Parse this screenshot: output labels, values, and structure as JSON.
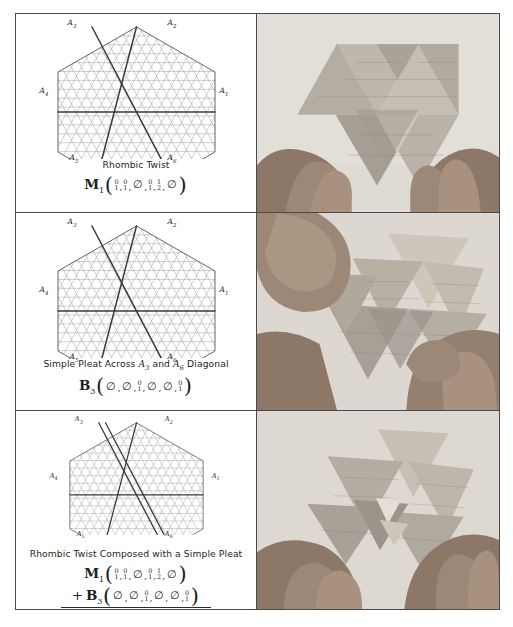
{
  "figure": {
    "panels": [
      {
        "id": "panel-1",
        "caption": "Rhombic Twist",
        "caption_parts": [
          {
            "t": "Rhombic Twist",
            "i": false
          }
        ],
        "diagram": {
          "name": "hexagon-triangular-grid-rhombic-twist",
          "vertices": [
            {
              "label": "A",
              "sub": "3",
              "pos": "top-left"
            },
            {
              "label": "A",
              "sub": "2",
              "pos": "top-right"
            },
            {
              "label": "A",
              "sub": "1",
              "pos": "right"
            },
            {
              "label": "A",
              "sub": "6",
              "pos": "bottom-right"
            },
            {
              "label": "A",
              "sub": "5",
              "pos": "bottom-left"
            },
            {
              "label": "A",
              "sub": "4",
              "pos": "left"
            }
          ],
          "bold_creases": [
            "A1-A4 horizontal",
            "A2-A5 diagonal",
            "A3-A6 diagonal"
          ],
          "double_line": false
        },
        "formulas": [
          {
            "symbol": "M",
            "sub": "1",
            "args": [
              {
                "type": "frac",
                "n": "0",
                "d": "1",
                "boxed": false
              },
              {
                "type": "frac",
                "n": "0",
                "d": "1",
                "boxed": false
              },
              {
                "type": "empty",
                "glyph": "∅"
              },
              {
                "type": "frac",
                "n": "0",
                "d": "1",
                "boxed": false
              },
              {
                "type": "frac",
                "n": "1",
                "d": "2",
                "boxed": false
              },
              {
                "type": "empty",
                "glyph": "∅"
              }
            ]
          }
        ],
        "photo_alt": "hands-folding-origami-rhombic-twist"
      },
      {
        "id": "panel-2",
        "caption": "Simple Pleat Across A3 and A6 Diagonal",
        "caption_parts": [
          {
            "t": "Simple Pleat Across ",
            "i": false
          },
          {
            "t": "A",
            "sub": "3",
            "i": true
          },
          {
            "t": " and ",
            "i": false
          },
          {
            "t": "A",
            "sub": "6",
            "i": true
          },
          {
            "t": " Diagonal",
            "i": false
          }
        ],
        "diagram": {
          "name": "hexagon-triangular-grid-simple-pleat",
          "vertices": [
            {
              "label": "A",
              "sub": "3",
              "pos": "top-left"
            },
            {
              "label": "A",
              "sub": "2",
              "pos": "top-right"
            },
            {
              "label": "A",
              "sub": "1",
              "pos": "right"
            },
            {
              "label": "A",
              "sub": "6",
              "pos": "bottom-right"
            },
            {
              "label": "A",
              "sub": "5",
              "pos": "bottom-left"
            },
            {
              "label": "A",
              "sub": "4",
              "pos": "left"
            }
          ],
          "bold_creases": [
            "A1-A4 horizontal",
            "A2-A5 diagonal",
            "A3-A6 diagonal"
          ],
          "double_line": false
        },
        "formulas": [
          {
            "symbol": "B",
            "sub": "3",
            "args": [
              {
                "type": "empty",
                "glyph": "∅"
              },
              {
                "type": "empty",
                "glyph": "∅"
              },
              {
                "type": "frac",
                "n": "0",
                "d": "1",
                "boxed": false
              },
              {
                "type": "empty",
                "glyph": "∅"
              },
              {
                "type": "empty",
                "glyph": "∅"
              },
              {
                "type": "frac",
                "n": "0",
                "d": "1",
                "boxed": false
              }
            ]
          }
        ],
        "photo_alt": "hands-folding-origami-simple-pleat"
      },
      {
        "id": "panel-3",
        "caption": "Rhombic Twist Composed with a Simple Pleat",
        "caption_parts": [
          {
            "t": "Rhombic Twist Composed with a Simple Pleat",
            "i": false
          }
        ],
        "diagram": {
          "name": "hexagon-triangular-grid-composed",
          "vertices": [
            {
              "label": "A",
              "sub": "3",
              "pos": "top-left"
            },
            {
              "label": "A",
              "sub": "2",
              "pos": "top-right"
            },
            {
              "label": "A",
              "sub": "1",
              "pos": "right"
            },
            {
              "label": "A",
              "sub": "6",
              "pos": "bottom-right"
            },
            {
              "label": "A",
              "sub": "5",
              "pos": "bottom-left"
            },
            {
              "label": "A",
              "sub": "4",
              "pos": "left"
            }
          ],
          "bold_creases": [
            "A1-A4 horizontal",
            "A2-A5 diagonal",
            "A3-A6 diagonal doubled"
          ],
          "double_line": true
        },
        "formulas": [
          {
            "symbol": "M",
            "sub": "1",
            "prefix": "",
            "args": [
              {
                "type": "frac",
                "n": "0",
                "d": "1",
                "boxed": false
              },
              {
                "type": "frac",
                "n": "0",
                "d": "1",
                "boxed": false
              },
              {
                "type": "empty",
                "glyph": "∅"
              },
              {
                "type": "frac",
                "n": "0",
                "d": "1",
                "boxed": false
              },
              {
                "type": "frac",
                "n": "1",
                "d": "2",
                "boxed": false
              },
              {
                "type": "empty",
                "glyph": "∅"
              }
            ]
          },
          {
            "symbol": "B",
            "sub": "3",
            "prefix": "+",
            "args": [
              {
                "type": "empty",
                "glyph": "∅"
              },
              {
                "type": "empty",
                "glyph": "∅"
              },
              {
                "type": "frac",
                "n": "0",
                "d": "1",
                "boxed": false
              },
              {
                "type": "empty",
                "glyph": "∅"
              },
              {
                "type": "empty",
                "glyph": "∅"
              },
              {
                "type": "frac",
                "n": "0",
                "d": "1",
                "boxed": false
              }
            ]
          },
          {
            "symbol": "H",
            "sub": "1",
            "prefix": "",
            "result": true,
            "args": [
              {
                "type": "frac",
                "n": "0",
                "d": "1",
                "boxed": false
              },
              {
                "type": "frac",
                "n": "0",
                "d": "1",
                "boxed": false
              },
              {
                "type": "frac",
                "n": "0",
                "d": "1",
                "boxed": true
              },
              {
                "type": "frac",
                "n": "0",
                "d": "1",
                "boxed": false
              },
              {
                "type": "frac",
                "n": "1",
                "d": "2",
                "boxed": false
              },
              {
                "type": "frac",
                "n": "0",
                "d": "1",
                "boxed": true
              }
            ]
          }
        ],
        "photo_alt": "hands-folding-origami-composed-twist"
      }
    ],
    "colors": {
      "border": "#4a4a4a",
      "grid_line": "#9a9a9a",
      "bold_crease": "#3a3a3a",
      "text": "#1d1d1d",
      "photo_paper": "#b9b2a8",
      "photo_skin": "#9c8878",
      "photo_background": "#d8d4cd"
    }
  }
}
